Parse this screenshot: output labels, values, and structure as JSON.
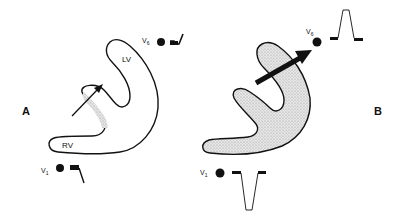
{
  "figure": {
    "panels": [
      {
        "id": "A",
        "label": "A",
        "chambers": {
          "lv": "LV",
          "rv": "RV"
        },
        "septum_shaded": true,
        "vector": "small thin arrow through septum pointing up-right",
        "leads": [
          {
            "name": "V",
            "sub": "6",
            "waveform": "small upright deflection"
          },
          {
            "name": "V",
            "sub": "1",
            "waveform": "small downward deflection"
          }
        ]
      },
      {
        "id": "B",
        "label": "B",
        "ventricle_shaded": true,
        "vector": "large thick arrow pointing toward V6",
        "leads": [
          {
            "name": "V",
            "sub": "6",
            "waveform": "tall upright R wave"
          },
          {
            "name": "V",
            "sub": "1",
            "waveform": "deep negative S wave"
          }
        ]
      }
    ],
    "colors": {
      "ink": "#111111",
      "shade": "#d4d4d4",
      "background": "#ffffff"
    }
  }
}
